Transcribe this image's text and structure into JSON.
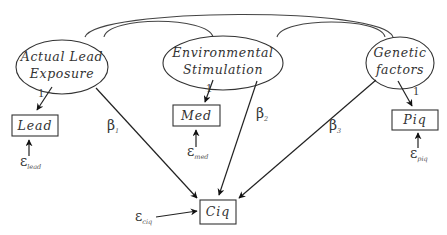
{
  "diagram": {
    "type": "structural-equation-model",
    "latent_nodes": [
      {
        "id": "actual_lead_exposure",
        "line1": "Actual Lead",
        "line2": "Exposure"
      },
      {
        "id": "environmental_stimulation",
        "line1": "Environmental",
        "line2": "Stimulation"
      },
      {
        "id": "genetic_factors",
        "line1": "Genetic",
        "line2": "factors"
      }
    ],
    "observed_nodes": [
      {
        "id": "lead",
        "label": "Lead"
      },
      {
        "id": "med",
        "label": "Med"
      },
      {
        "id": "piq",
        "label": "Piq"
      },
      {
        "id": "ciq",
        "label": "Ciq"
      }
    ],
    "loadings": [
      {
        "from": "actual_lead_exposure",
        "to": "lead",
        "label": "1"
      },
      {
        "from": "environmental_stimulation",
        "to": "med",
        "label": "1"
      },
      {
        "from": "genetic_factors",
        "to": "piq",
        "label": "1"
      }
    ],
    "paths": [
      {
        "from": "actual_lead_exposure",
        "to": "ciq",
        "symbol": "β",
        "subscript": "1"
      },
      {
        "from": "environmental_stimulation",
        "to": "ciq",
        "symbol": "β",
        "subscript": "2"
      },
      {
        "from": "genetic_factors",
        "to": "ciq",
        "symbol": "β",
        "subscript": "3"
      }
    ],
    "errors": [
      {
        "to": "lead",
        "symbol": "ε",
        "subscript": "lead"
      },
      {
        "to": "med",
        "symbol": "ε",
        "subscript": "med"
      },
      {
        "to": "piq",
        "symbol": "ε",
        "subscript": "piq"
      },
      {
        "to": "ciq",
        "symbol": "ε",
        "subscript": "ciq"
      }
    ],
    "covariances": [
      {
        "between": [
          "actual_lead_exposure",
          "genetic_factors"
        ]
      },
      {
        "between": [
          "actual_lead_exposure",
          "environmental_stimulation"
        ]
      },
      {
        "between": [
          "environmental_stimulation",
          "genetic_factors"
        ]
      }
    ]
  }
}
